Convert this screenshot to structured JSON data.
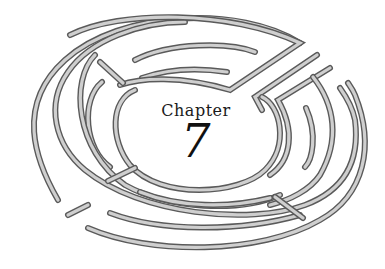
{
  "illustration": {
    "type": "labyrinth",
    "stroke_color": "#5a5a5a",
    "fill_color": "#cfcfcf",
    "background": "#ffffff"
  },
  "center": {
    "label": "Chapter",
    "number": "7"
  }
}
